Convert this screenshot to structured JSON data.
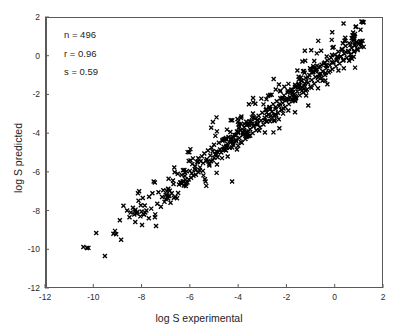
{
  "figure": {
    "width": 398,
    "height": 334,
    "background": "#ffffff",
    "frame_color": "#5a5a5a",
    "marker_color": "#000000"
  },
  "annotations": {
    "n_label": "n = 496",
    "r_label": "r = 0.96",
    "s_label": "s = 0.59"
  },
  "chart_data": {
    "type": "scatter",
    "title": "",
    "xlabel": "log S experimental",
    "ylabel": "log S predicted",
    "xlim": [
      -12,
      2
    ],
    "ylim": [
      -12,
      2
    ],
    "xticks": [
      -12,
      -10,
      -8,
      -6,
      -4,
      -2,
      0,
      2
    ],
    "yticks": [
      -12,
      -10,
      -8,
      -6,
      -4,
      -2,
      0,
      2
    ],
    "xticklabels": [
      "-12",
      "-10",
      "-8",
      "-6",
      "-4",
      "-2",
      "0",
      "2"
    ],
    "yticklabels": [
      "-12",
      "-10",
      "-8",
      "-6",
      "-4",
      "-2",
      "0",
      "2"
    ],
    "grid": false,
    "legend": null,
    "marker": "x",
    "marker_size": 4,
    "n_points": 496,
    "correlation_r": 0.96,
    "std_error_s": 0.59,
    "annotations": [
      "n = 496",
      "r = 0.96",
      "s = 0.59"
    ],
    "series": [
      {
        "name": "compounds",
        "points": [
          [
            -10.41,
            -9.88
          ],
          [
            -10.26,
            -9.93
          ],
          [
            -9.1,
            -9.05
          ],
          [
            -9.05,
            -9.22
          ],
          [
            -8.9,
            -8.5
          ],
          [
            -8.75,
            -7.75
          ],
          [
            -8.6,
            -8.0
          ],
          [
            -8.5,
            -8.35
          ],
          [
            -8.45,
            -8.1
          ],
          [
            -8.3,
            -8.2
          ],
          [
            -8.25,
            -7.95
          ],
          [
            -8.2,
            -8.15
          ],
          [
            -8.15,
            -7.1
          ],
          [
            -8.1,
            -7.0
          ],
          [
            -8.05,
            -8.3
          ],
          [
            -8.0,
            -8.05
          ],
          [
            -7.98,
            -8.75
          ],
          [
            -7.95,
            -7.35
          ],
          [
            -7.9,
            -8.2
          ],
          [
            -7.85,
            -8.1
          ],
          [
            -7.8,
            -8.0
          ],
          [
            -7.7,
            -8.4
          ],
          [
            -7.6,
            -7.9
          ],
          [
            -7.55,
            -7.1
          ],
          [
            -7.5,
            -6.5
          ],
          [
            -7.45,
            -6.55
          ],
          [
            -7.4,
            -8.8
          ],
          [
            -7.35,
            -7.65
          ],
          [
            -7.3,
            -7.05
          ],
          [
            -7.2,
            -7.8
          ],
          [
            -7.15,
            -7.3
          ],
          [
            -7.1,
            -6.95
          ],
          [
            -7.05,
            -7.55
          ],
          [
            -7.0,
            -7.2
          ],
          [
            -6.95,
            -7.0
          ],
          [
            -6.9,
            -6.9
          ],
          [
            -6.85,
            -7.25
          ],
          [
            -6.8,
            -7.6
          ],
          [
            -6.75,
            -7.1
          ],
          [
            -6.7,
            -6.45
          ],
          [
            -6.6,
            -7.3
          ],
          [
            -6.5,
            -6.1
          ],
          [
            -6.45,
            -6.65
          ],
          [
            -6.4,
            -6.55
          ],
          [
            -6.35,
            -6.6
          ],
          [
            -6.3,
            -6.5
          ],
          [
            -6.25,
            -6.7
          ],
          [
            -6.2,
            -6.05
          ],
          [
            -6.15,
            -6.6
          ],
          [
            -6.1,
            -6.55
          ],
          [
            -6.05,
            -6.4
          ],
          [
            -6.0,
            -5.95
          ],
          [
            -5.95,
            -6.3
          ],
          [
            -5.9,
            -5.6
          ],
          [
            -5.85,
            -6.2
          ],
          [
            -5.8,
            -5.85
          ],
          [
            -5.75,
            -6.15
          ],
          [
            -5.7,
            -5.5
          ],
          [
            -5.65,
            -5.3
          ],
          [
            -5.6,
            -5.9
          ],
          [
            -5.55,
            -5.45
          ],
          [
            -5.5,
            -5.2
          ],
          [
            -5.45,
            -5.55
          ],
          [
            -5.4,
            -5.05
          ],
          [
            -5.35,
            -6.5
          ],
          [
            -5.3,
            -5.35
          ],
          [
            -5.25,
            -4.9
          ],
          [
            -5.2,
            -5.6
          ],
          [
            -5.15,
            -5.15
          ],
          [
            -5.1,
            -4.75
          ],
          [
            -5.05,
            -5.4
          ],
          [
            -5.0,
            -4.6
          ],
          [
            -4.95,
            -5.1
          ],
          [
            -4.9,
            -4.95
          ],
          [
            -4.85,
            -5.25
          ],
          [
            -4.8,
            -4.5
          ],
          [
            -4.75,
            -4.85
          ],
          [
            -4.7,
            -5.0
          ],
          [
            -4.65,
            -4.4
          ],
          [
            -4.6,
            -4.7
          ],
          [
            -4.55,
            -4.3
          ],
          [
            -4.5,
            -4.9
          ],
          [
            -4.45,
            -4.55
          ],
          [
            -4.4,
            -4.2
          ],
          [
            -4.35,
            -4.75
          ],
          [
            -4.3,
            -4.45
          ],
          [
            -4.25,
            -6.5
          ],
          [
            -4.2,
            -4.6
          ],
          [
            -4.15,
            -4.1
          ],
          [
            -4.1,
            -4.35
          ],
          [
            -4.05,
            -4.85
          ],
          [
            -4.0,
            -4.0
          ],
          [
            -3.95,
            -4.25
          ],
          [
            -3.9,
            -3.85
          ],
          [
            -3.85,
            -4.5
          ],
          [
            -3.8,
            -4.1
          ],
          [
            -3.75,
            -3.7
          ],
          [
            -3.7,
            -4.3
          ],
          [
            -3.65,
            -3.95
          ],
          [
            -3.6,
            -3.55
          ],
          [
            -3.55,
            -4.15
          ],
          [
            -3.5,
            -3.8
          ],
          [
            -3.45,
            -3.4
          ],
          [
            -3.4,
            -4.0
          ],
          [
            -3.35,
            -3.65
          ],
          [
            -3.3,
            -3.25
          ],
          [
            -3.25,
            -3.85
          ],
          [
            -3.2,
            -3.5
          ],
          [
            -3.15,
            -3.1
          ],
          [
            -3.1,
            -3.7
          ],
          [
            -3.05,
            -3.35
          ],
          [
            -3.0,
            -2.95
          ],
          [
            -2.95,
            -3.55
          ],
          [
            -2.9,
            -3.2
          ],
          [
            -2.85,
            -2.8
          ],
          [
            -2.8,
            -3.4
          ],
          [
            -2.75,
            -3.05
          ],
          [
            -2.7,
            -2.65
          ],
          [
            -2.65,
            -3.25
          ],
          [
            -2.6,
            -2.9
          ],
          [
            -2.55,
            -2.5
          ],
          [
            -2.5,
            -3.1
          ],
          [
            -2.45,
            -2.75
          ],
          [
            -2.4,
            -2.35
          ],
          [
            -2.35,
            -2.95
          ],
          [
            -2.3,
            -2.6
          ],
          [
            -2.25,
            -2.2
          ],
          [
            -2.2,
            -2.8
          ],
          [
            -2.15,
            -2.45
          ],
          [
            -2.1,
            -2.05
          ],
          [
            -2.05,
            -2.65
          ],
          [
            -2.0,
            -2.3
          ],
          [
            -1.95,
            -1.9
          ],
          [
            -1.9,
            -2.5
          ],
          [
            -1.85,
            -2.15
          ],
          [
            -1.8,
            -1.75
          ],
          [
            -1.75,
            -2.35
          ],
          [
            -1.7,
            -2.0
          ],
          [
            -1.65,
            -1.6
          ],
          [
            -1.6,
            -2.2
          ],
          [
            -1.55,
            -1.85
          ],
          [
            -1.5,
            -1.45
          ],
          [
            -1.45,
            -2.05
          ],
          [
            -1.4,
            -1.7
          ],
          [
            -1.35,
            -1.3
          ],
          [
            -1.3,
            -1.9
          ],
          [
            -1.25,
            -1.55
          ],
          [
            -1.2,
            -1.15
          ],
          [
            -1.15,
            -1.75
          ],
          [
            -1.1,
            -1.4
          ],
          [
            -1.05,
            -1.0
          ],
          [
            -1.0,
            -1.6
          ],
          [
            -0.95,
            -1.25
          ],
          [
            -0.9,
            -0.85
          ],
          [
            -0.85,
            -1.45
          ],
          [
            -0.8,
            -1.1
          ],
          [
            -0.75,
            -0.7
          ],
          [
            -0.7,
            -1.3
          ],
          [
            -0.65,
            -0.95
          ],
          [
            -0.6,
            -0.55
          ],
          [
            -0.55,
            -1.15
          ],
          [
            -0.5,
            -0.8
          ],
          [
            -0.45,
            -0.4
          ],
          [
            -0.4,
            -1.0
          ],
          [
            -0.35,
            -0.65
          ],
          [
            -0.3,
            -0.25
          ],
          [
            -0.25,
            -0.85
          ],
          [
            -0.2,
            -0.5
          ],
          [
            -0.15,
            -0.1
          ],
          [
            -0.1,
            -0.7
          ],
          [
            -0.05,
            -0.35
          ],
          [
            0.0,
            0.05
          ],
          [
            0.05,
            -0.55
          ],
          [
            0.1,
            -0.2
          ],
          [
            0.15,
            0.2
          ],
          [
            0.2,
            -0.4
          ],
          [
            0.25,
            -0.05
          ],
          [
            0.3,
            0.35
          ],
          [
            0.35,
            -0.25
          ],
          [
            0.4,
            0.1
          ],
          [
            0.45,
            0.5
          ],
          [
            0.5,
            -0.1
          ],
          [
            0.55,
            0.25
          ],
          [
            0.6,
            0.65
          ],
          [
            0.65,
            0.05
          ],
          [
            0.7,
            0.4
          ],
          [
            0.75,
            0.75
          ],
          [
            0.8,
            0.2
          ],
          [
            0.85,
            0.55
          ],
          [
            0.9,
            0.7
          ],
          [
            0.95,
            0.3
          ],
          [
            1.0,
            0.6
          ],
          [
            1.05,
            0.75
          ],
          [
            1.1,
            0.45
          ]
        ]
      }
    ]
  }
}
